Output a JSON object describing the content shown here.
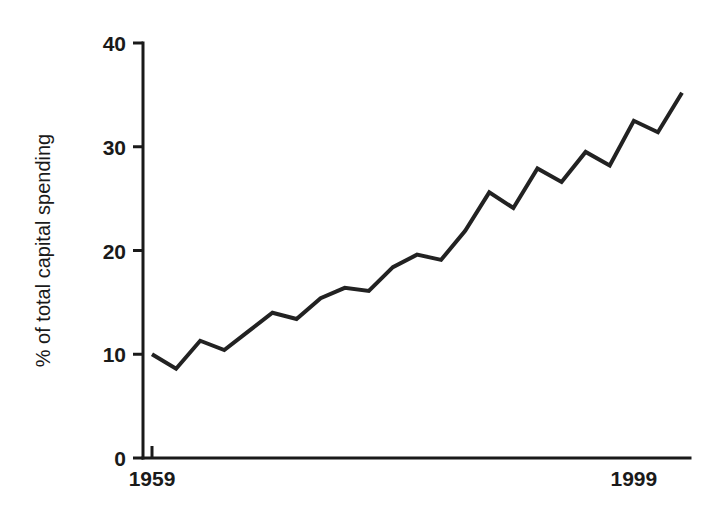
{
  "chart_data": {
    "type": "line",
    "title": "",
    "subtitle": "",
    "xlabel": "",
    "ylabel": "% of total capital spending",
    "xlim": [
      1959,
      2003
    ],
    "ylim": [
      0,
      40
    ],
    "grid": false,
    "legend": "none",
    "x_tick_labels": [
      "1959",
      "1999"
    ],
    "x_tick_values": [
      1959,
      1999
    ],
    "y_tick_labels": [
      "0",
      "10",
      "20",
      "30",
      "40"
    ],
    "y_tick_values": [
      0,
      10,
      20,
      30,
      40
    ],
    "line_color": "#222222",
    "line_width": 4,
    "x": [
      1959,
      1961,
      1963,
      1965,
      1967,
      1969,
      1971,
      1973,
      1975,
      1977,
      1979,
      1981,
      1983,
      1985,
      1987,
      1989,
      1991,
      1993,
      1995,
      1997,
      1999,
      2001,
      2003
    ],
    "values": [
      10.0,
      8.6,
      11.3,
      10.4,
      12.2,
      14.0,
      13.4,
      15.4,
      16.4,
      16.1,
      18.4,
      19.6,
      19.1,
      21.9,
      25.6,
      24.1,
      27.9,
      26.6,
      29.5,
      28.2,
      32.5,
      31.4,
      35.2
    ],
    "series": [
      {
        "name": "% of total capital spending",
        "values": [
          10.0,
          8.6,
          11.3,
          10.4,
          12.2,
          14.0,
          13.4,
          15.4,
          16.4,
          16.1,
          18.4,
          19.6,
          19.1,
          21.9,
          25.6,
          24.1,
          27.9,
          26.6,
          29.5,
          28.2,
          32.5,
          31.4,
          35.2
        ]
      }
    ]
  },
  "plot_geometry": {
    "left": 143,
    "right": 690,
    "top": 43,
    "bottom": 458,
    "x_first": 152,
    "x_last": 682,
    "axis_color": "#1a1a1a",
    "axis_width": 3
  }
}
